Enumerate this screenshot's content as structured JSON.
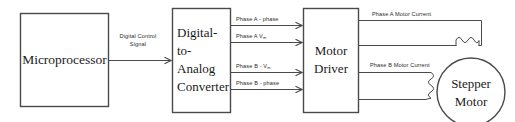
{
  "diagram": {
    "type": "block-diagram",
    "colors": {
      "background": "#ffffff",
      "box_stroke": "#4a4a4a",
      "wire_stroke": "#4a4a4a",
      "block_text": "#1a1a1a",
      "wire_text": "#2b2b2b"
    },
    "blocks": {
      "microprocessor": {
        "label": "Microprocessor"
      },
      "dac": {
        "line1": "Digital-",
        "line2": "to-",
        "line3": "Analog",
        "line4": "Converter"
      },
      "motor_driver": {
        "line1": "Motor",
        "line2": "Driver"
      },
      "stepper_motor": {
        "line1": "Stepper",
        "line2": "Motor"
      }
    },
    "signals": {
      "digital_control": {
        "line1": "Digital Control",
        "line2": "Signal"
      },
      "phase_a_phase": "Phase A - phase",
      "phase_a_v": "Phase A V",
      "phase_a_v_sub": "m",
      "phase_b_v": "Phase B - V",
      "phase_b_v_sub": "m",
      "phase_b_phase": "Phase B - phase",
      "phase_a_current": "Phase A Motor Current",
      "phase_b_current": "Phase B Motor Current"
    }
  }
}
